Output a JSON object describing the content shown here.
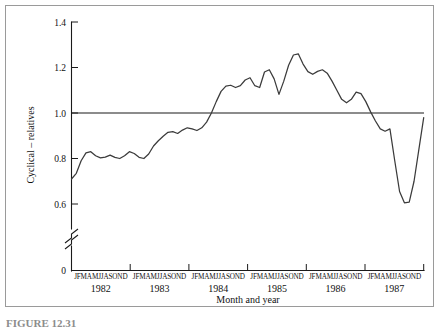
{
  "figure": {
    "caption": "FIGURE 12.31"
  },
  "chart_data": {
    "type": "line",
    "title": "",
    "subtitle": "",
    "xlabel": "Month and year",
    "ylabel": "Cyclical – relatives",
    "ylim": [
      0.5,
      1.4
    ],
    "yticks": [
      "0",
      "0.6",
      "0.8",
      "1.0",
      "1.2",
      "1.4"
    ],
    "ytick_values": [
      0,
      0.6,
      0.8,
      1.0,
      1.2,
      1.4
    ],
    "axis_break": true,
    "axis_break_between": [
      "0",
      "0.6"
    ],
    "grid": false,
    "legend": null,
    "reference_lines": [
      {
        "axis": "y",
        "value": 1.0,
        "label": "1.0 baseline"
      }
    ],
    "years": [
      "1982",
      "1983",
      "1984",
      "1985",
      "1986",
      "1987"
    ],
    "month_letters": "JFMAMJJASOND",
    "month_letter_list": [
      "J",
      "F",
      "M",
      "A",
      "M",
      "J",
      "J",
      "A",
      "S",
      "O",
      "N",
      "D"
    ],
    "x": [
      "1982-J",
      "1982-F",
      "1982-M",
      "1982-A",
      "1982-M",
      "1982-J",
      "1982-J",
      "1982-A",
      "1982-S",
      "1982-O",
      "1982-N",
      "1982-D",
      "1983-J",
      "1983-F",
      "1983-M",
      "1983-A",
      "1983-M",
      "1983-J",
      "1983-J",
      "1983-A",
      "1983-S",
      "1983-O",
      "1983-N",
      "1983-D",
      "1984-J",
      "1984-F",
      "1984-M",
      "1984-A",
      "1984-M",
      "1984-J",
      "1984-J",
      "1984-A",
      "1984-S",
      "1984-O",
      "1984-N",
      "1984-D",
      "1985-J",
      "1985-F",
      "1985-M",
      "1985-A",
      "1985-M",
      "1985-J",
      "1985-J",
      "1985-A",
      "1985-S",
      "1985-O",
      "1985-N",
      "1985-D",
      "1986-J",
      "1986-F",
      "1986-M",
      "1986-A",
      "1986-M",
      "1986-J",
      "1986-J",
      "1986-A",
      "1986-S",
      "1986-O",
      "1986-N",
      "1986-D",
      "1987-J",
      "1987-F",
      "1987-M",
      "1987-A",
      "1987-M",
      "1987-J",
      "1987-J",
      "1987-A",
      "1987-S",
      "1987-O",
      "1987-N",
      "1987-D"
    ],
    "values": [
      0.71,
      0.735,
      0.79,
      0.825,
      0.83,
      0.812,
      0.803,
      0.806,
      0.815,
      0.805,
      0.8,
      0.812,
      0.83,
      0.822,
      0.805,
      0.8,
      0.82,
      0.855,
      0.878,
      0.898,
      0.915,
      0.918,
      0.91,
      0.925,
      0.935,
      0.93,
      0.923,
      0.935,
      0.96,
      1.0,
      1.05,
      1.095,
      1.118,
      1.122,
      1.112,
      1.12,
      1.145,
      1.155,
      1.12,
      1.112,
      1.18,
      1.19,
      1.15,
      1.082,
      1.14,
      1.21,
      1.255,
      1.26,
      1.215,
      1.182,
      1.17,
      1.183,
      1.19,
      1.175,
      1.14,
      1.1,
      1.06,
      1.045,
      1.06,
      1.092,
      1.085,
      1.05,
      1.005,
      0.965,
      0.93,
      0.92,
      0.93,
      0.79,
      0.655,
      0.605,
      0.608,
      0.7
    ],
    "series": [
      {
        "name": "Cyclical relatives",
        "values": [
          0.71,
          0.735,
          0.79,
          0.825,
          0.83,
          0.812,
          0.803,
          0.806,
          0.815,
          0.805,
          0.8,
          0.812,
          0.83,
          0.822,
          0.805,
          0.8,
          0.82,
          0.855,
          0.878,
          0.898,
          0.915,
          0.918,
          0.91,
          0.925,
          0.935,
          0.93,
          0.923,
          0.935,
          0.96,
          1.0,
          1.05,
          1.095,
          1.118,
          1.122,
          1.112,
          1.12,
          1.145,
          1.155,
          1.12,
          1.112,
          1.18,
          1.19,
          1.15,
          1.082,
          1.14,
          1.21,
          1.255,
          1.26,
          1.215,
          1.182,
          1.17,
          1.183,
          1.19,
          1.175,
          1.14,
          1.1,
          1.06,
          1.045,
          1.06,
          1.092,
          1.085,
          1.05,
          1.005,
          0.965,
          0.93,
          0.92,
          0.93,
          0.79,
          0.655,
          0.605,
          0.608,
          0.7
        ],
        "color": "#3b3b3b"
      }
    ],
    "tail_values": [
      0.84,
      0.98
    ],
    "annotations": [],
    "colors": {
      "line": "#3b3b3b",
      "axis": "#1a1a1a",
      "frame": "#9a9a9a",
      "background": "#ffffff"
    }
  }
}
